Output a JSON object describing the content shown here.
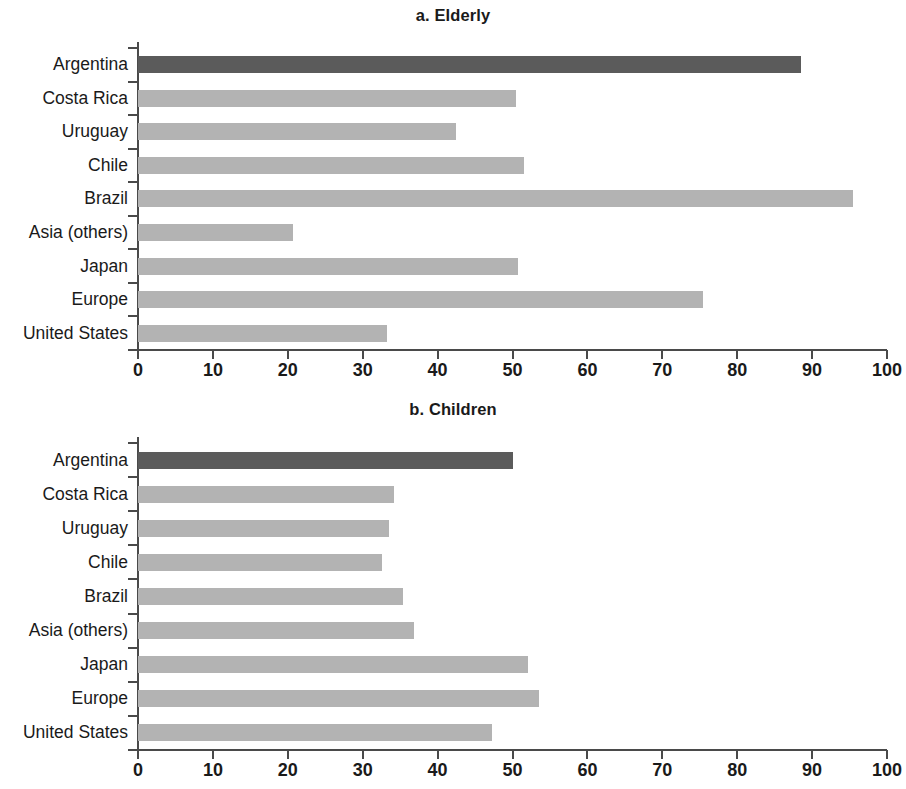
{
  "figure": {
    "width": 906,
    "height": 789,
    "background": "#ffffff"
  },
  "colors": {
    "bar_default": "#b3b3b3",
    "bar_highlight": "#5b5b5b",
    "axis": "#4a4a4a",
    "text": "#1a1a1a"
  },
  "chart_data": [
    {
      "type": "bar",
      "orientation": "horizontal",
      "title": "a. Elderly",
      "xlabel": "",
      "ylabel": "",
      "xlim": [
        0,
        100
      ],
      "xticks": [
        0,
        10,
        20,
        30,
        40,
        50,
        60,
        70,
        80,
        90,
        100
      ],
      "xtick_labels": [
        "0",
        "10",
        "20",
        "30",
        "40",
        "50",
        "60",
        "70",
        "80",
        "90",
        "100"
      ],
      "grid": false,
      "legend": null,
      "categories": [
        "Argentina",
        "Costa Rica",
        "Uruguay",
        "Chile",
        "Brazil",
        "Asia (others)",
        "Japan",
        "Europe",
        "United States"
      ],
      "values": [
        88.5,
        50.5,
        42.5,
        51.5,
        95.5,
        20.7,
        50.7,
        75.5,
        33.3
      ],
      "highlight_index": 0
    },
    {
      "type": "bar",
      "orientation": "horizontal",
      "title": "b. Children",
      "xlabel": "",
      "ylabel": "",
      "xlim": [
        0,
        100
      ],
      "xticks": [
        0,
        10,
        20,
        30,
        40,
        50,
        60,
        70,
        80,
        90,
        100
      ],
      "xtick_labels": [
        "0",
        "10",
        "20",
        "30",
        "40",
        "50",
        "60",
        "70",
        "80",
        "90",
        "100"
      ],
      "grid": false,
      "legend": null,
      "categories": [
        "Argentina",
        "Costa Rica",
        "Uruguay",
        "Chile",
        "Brazil",
        "Asia (others)",
        "Japan",
        "Europe",
        "United States"
      ],
      "values": [
        50.0,
        34.2,
        33.5,
        32.6,
        35.4,
        36.8,
        52.1,
        53.6,
        47.2
      ],
      "highlight_index": 0
    }
  ]
}
